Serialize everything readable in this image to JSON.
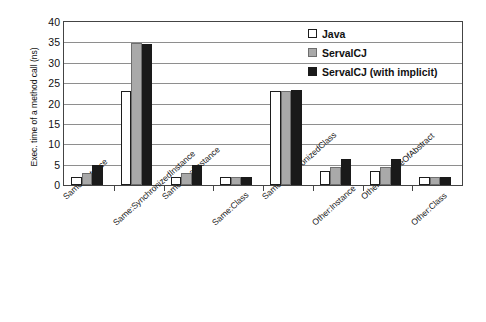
{
  "chart_data": {
    "type": "bar",
    "title": "",
    "xlabel": "",
    "ylabel": "Exec. time of a method call (ns)",
    "ylim": [
      0,
      40
    ],
    "ytick_step": 5,
    "yticks": [
      0,
      5,
      10,
      15,
      20,
      25,
      30,
      35,
      40
    ],
    "grid": true,
    "grid_axis": "y",
    "legend_position": "upper right (inside plot area)",
    "categories": [
      "Same:Instance",
      "Same:SynchronizedInstance",
      "Same:FinalInstance",
      "Same:Class",
      "Same:SynchronizedClass",
      "Other:Instance",
      "Other:InstanceOfAbstract",
      "Other:Class"
    ],
    "series": [
      {
        "name": "Java",
        "color": "#ffffff",
        "edge_color": "#1d1d1d",
        "values": [
          2,
          23,
          2,
          2,
          23,
          3.5,
          3.5,
          2
        ]
      },
      {
        "name": "ServalCJ",
        "color": "#a9a9a9",
        "edge_color": "#6e6e6e",
        "values": [
          3,
          34.8,
          3,
          2,
          23,
          4.5,
          4.5,
          2
        ]
      },
      {
        "name": "ServalCJ (with implicit)",
        "color": "#1a1a1a",
        "edge_color": "#1a1a1a",
        "values": [
          5,
          34.7,
          5,
          2,
          23.2,
          6.5,
          6.5,
          2
        ]
      }
    ]
  },
  "axis": {
    "y_title": "Exec. time of a method call (ns)"
  }
}
